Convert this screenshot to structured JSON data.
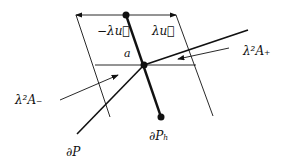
{
  "labels": {
    "neg_lambda_u": "−λu⃗",
    "lambda_u": "λu⃗",
    "a": "a",
    "lambda2_A_plus": "λ²A₊",
    "lambda2_A_minus": "λ²A₋",
    "dP": "∂P",
    "dP_h": "∂Pₕ"
  },
  "colors": {
    "stroke": "#111111",
    "background": "#ffffff"
  }
}
